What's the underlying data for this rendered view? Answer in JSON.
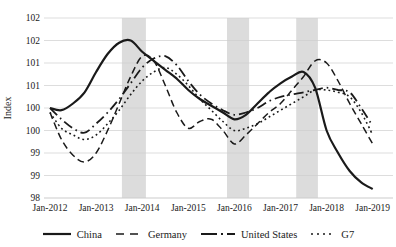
{
  "chart_data": {
    "type": "line",
    "title": "",
    "ylabel": "Index",
    "xlabel": "",
    "ylim": [
      98,
      102
    ],
    "xlim_years": [
      2012.0,
      2019.0
    ],
    "grid": "horizontal",
    "legend_position": "bottom",
    "y_ticks": [
      98,
      98.5,
      99,
      99.5,
      100,
      100.5,
      101,
      101.5,
      102
    ],
    "y_tick_labels": [
      "98",
      "99",
      "99",
      "100",
      "100",
      "101",
      "101",
      "102",
      "102"
    ],
    "x_tick_labels": [
      "Jan-2012",
      "Jan-2013",
      "Jan-2014",
      "Jan-2015",
      "Jan-2016",
      "Jan-2017",
      "Jan-2018",
      "Jan-2019"
    ],
    "shaded_bands": [
      {
        "start_year": 2013.56,
        "end_year": 2014.08
      },
      {
        "start_year": 2015.84,
        "end_year": 2016.32
      },
      {
        "start_year": 2017.34,
        "end_year": 2017.81
      }
    ],
    "band_color": "#dcdcdc",
    "line_color": "#1a1a1a",
    "gridline_color": "#cccccc",
    "x": [
      2012.0,
      2012.25,
      2012.5,
      2012.75,
      2013.0,
      2013.25,
      2013.5,
      2013.75,
      2014.0,
      2014.25,
      2014.5,
      2014.75,
      2015.0,
      2015.25,
      2015.5,
      2015.75,
      2016.0,
      2016.25,
      2016.5,
      2016.75,
      2017.0,
      2017.25,
      2017.5,
      2017.75,
      2018.0,
      2018.25,
      2018.5,
      2018.75,
      2019.0
    ],
    "series": [
      {
        "name": "China",
        "dash": "solid",
        "values": [
          100.0,
          99.95,
          100.1,
          100.35,
          100.8,
          101.2,
          101.45,
          101.5,
          101.25,
          101.05,
          100.85,
          100.65,
          100.4,
          100.2,
          100.05,
          99.9,
          99.75,
          99.85,
          100.1,
          100.35,
          100.55,
          100.7,
          100.8,
          100.45,
          99.5,
          99.0,
          98.6,
          98.35,
          98.2
        ]
      },
      {
        "name": "Germany",
        "dash": "dashed",
        "values": [
          99.9,
          99.3,
          98.95,
          98.8,
          99.0,
          99.5,
          100.1,
          100.7,
          101.15,
          101.05,
          100.5,
          99.9,
          99.55,
          99.7,
          99.75,
          99.5,
          99.2,
          99.4,
          99.65,
          99.9,
          100.1,
          100.4,
          100.7,
          101.05,
          101.0,
          100.6,
          100.1,
          99.65,
          99.2
        ]
      },
      {
        "name": "United States",
        "dash": "dashdot",
        "values": [
          100.0,
          99.75,
          99.55,
          99.45,
          99.65,
          99.9,
          100.2,
          100.55,
          100.9,
          101.1,
          101.15,
          100.95,
          100.6,
          100.3,
          100.1,
          99.95,
          99.85,
          99.9,
          100.0,
          100.15,
          100.25,
          100.3,
          100.35,
          100.4,
          100.45,
          100.4,
          100.35,
          100.0,
          99.6
        ]
      },
      {
        "name": "G7",
        "dash": "dotted",
        "values": [
          99.9,
          99.55,
          99.4,
          99.3,
          99.4,
          99.65,
          99.95,
          100.3,
          100.6,
          100.8,
          100.9,
          100.75,
          100.5,
          100.2,
          99.95,
          99.7,
          99.5,
          99.55,
          99.65,
          99.8,
          99.95,
          100.1,
          100.25,
          100.4,
          100.4,
          100.35,
          100.25,
          99.9,
          99.4
        ]
      }
    ]
  }
}
